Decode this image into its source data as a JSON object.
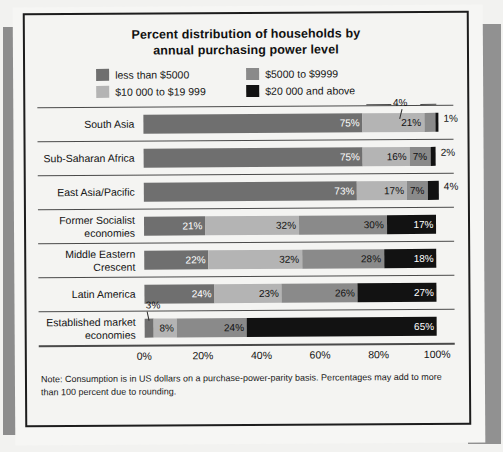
{
  "chart_data": {
    "type": "bar",
    "orientation": "horizontal",
    "stacked": true,
    "title": "Percent distribution of households by annual purchasing power level",
    "title_line1": "Percent distribution of households by",
    "title_line2": "annual purchasing power level",
    "xlabel": "",
    "ylabel": "",
    "xlim": [
      0,
      100
    ],
    "grid": false,
    "legend_position": "top",
    "tick_labels": [
      "0%",
      "20%",
      "40%",
      "60%",
      "80%",
      "100%"
    ],
    "tick_values": [
      0,
      20,
      40,
      60,
      80,
      100
    ],
    "categories": [
      "South Asia",
      "Sub-Saharan Africa",
      "East Asia/Pacific",
      "Former Socialist economies",
      "Middle Eastern Crescent",
      "Latin America",
      "Established market economies"
    ],
    "series": [
      {
        "name": "less than $5000",
        "color": "#6f6f6f",
        "values": [
          75,
          75,
          73,
          21,
          22,
          24,
          3
        ]
      },
      {
        "name": "$10 000 to $19 999",
        "color": "#b4b4b4",
        "values": [
          21,
          16,
          17,
          32,
          32,
          23,
          8
        ]
      },
      {
        "name": "$5000 to $9999",
        "color": "#8a8a8a",
        "values": [
          4,
          7,
          7,
          30,
          28,
          26,
          24
        ]
      },
      {
        "name": "$20 000 and above",
        "color": "#121212",
        "values": [
          1,
          2,
          4,
          17,
          18,
          27,
          65
        ]
      }
    ],
    "annotations": [
      {
        "label": "4%",
        "category": "South Asia",
        "series": "$5000 to $9999",
        "value": 4
      },
      {
        "label": "3%",
        "category": "Established market economies",
        "series": "less than $5000",
        "value": 3
      }
    ],
    "note": "Note: Consumption is in US dollars on a purchase-power-parity basis. Percentages may add to more than 100 percent due to rounding."
  },
  "legend": {
    "items": [
      {
        "label": "less than $5000",
        "color": "#6f6f6f"
      },
      {
        "label": "$5000 to $9999",
        "color": "#8a8a8a"
      },
      {
        "label": "$10 000 to $19 999",
        "color": "#b4b4b4"
      },
      {
        "label": "$20 000 and above",
        "color": "#121212"
      }
    ]
  },
  "rows": [
    {
      "label": "South Asia",
      "label_line1": "South Asia",
      "label_line2": "",
      "segments": [
        {
          "value": 75,
          "text": "75%",
          "color": "#6f6f6f",
          "text_color": "#ffffff",
          "inside": true
        },
        {
          "value": 21,
          "text": "21%",
          "color": "#b4b4b4",
          "text_color": "#111111",
          "inside": true
        },
        {
          "value": 4,
          "text": "",
          "color": "#8a8a8a",
          "text_color": "#111111",
          "inside": true
        },
        {
          "value": 1,
          "text": "",
          "color": "#121212",
          "text_color": "#111111",
          "inside": true
        }
      ],
      "outside_label": "1%",
      "callout": "4%"
    },
    {
      "label": "Sub-Saharan Africa",
      "label_line1": "Sub-Saharan Africa",
      "label_line2": "",
      "segments": [
        {
          "value": 75,
          "text": "75%",
          "color": "#6f6f6f",
          "text_color": "#ffffff",
          "inside": true
        },
        {
          "value": 16,
          "text": "16%",
          "color": "#b4b4b4",
          "text_color": "#111111",
          "inside": true
        },
        {
          "value": 7,
          "text": "7%",
          "color": "#8a8a8a",
          "text_color": "#111111",
          "inside": true
        },
        {
          "value": 2,
          "text": "",
          "color": "#121212",
          "text_color": "#ffffff",
          "inside": true
        }
      ],
      "outside_label": "2%",
      "callout": ""
    },
    {
      "label": "East Asia/Pacific",
      "label_line1": "East Asia/Pacific",
      "label_line2": "",
      "segments": [
        {
          "value": 73,
          "text": "73%",
          "color": "#6f6f6f",
          "text_color": "#ffffff",
          "inside": true
        },
        {
          "value": 17,
          "text": "17%",
          "color": "#b4b4b4",
          "text_color": "#111111",
          "inside": true
        },
        {
          "value": 7,
          "text": "7%",
          "color": "#8a8a8a",
          "text_color": "#111111",
          "inside": true
        },
        {
          "value": 4,
          "text": "",
          "color": "#121212",
          "text_color": "#ffffff",
          "inside": true
        }
      ],
      "outside_label": "4%",
      "callout": ""
    },
    {
      "label": "Former Socialist economies",
      "label_line1": "Former Socialist",
      "label_line2": "economies",
      "segments": [
        {
          "value": 21,
          "text": "21%",
          "color": "#6f6f6f",
          "text_color": "#ffffff",
          "inside": true
        },
        {
          "value": 32,
          "text": "32%",
          "color": "#b4b4b4",
          "text_color": "#111111",
          "inside": true
        },
        {
          "value": 30,
          "text": "30%",
          "color": "#8a8a8a",
          "text_color": "#111111",
          "inside": true
        },
        {
          "value": 17,
          "text": "17%",
          "color": "#121212",
          "text_color": "#ffffff",
          "inside": true
        }
      ],
      "outside_label": "",
      "callout": ""
    },
    {
      "label": "Middle Eastern Crescent",
      "label_line1": "Middle Eastern",
      "label_line2": "Crescent",
      "segments": [
        {
          "value": 22,
          "text": "22%",
          "color": "#6f6f6f",
          "text_color": "#ffffff",
          "inside": true
        },
        {
          "value": 32,
          "text": "32%",
          "color": "#b4b4b4",
          "text_color": "#111111",
          "inside": true
        },
        {
          "value": 28,
          "text": "28%",
          "color": "#8a8a8a",
          "text_color": "#111111",
          "inside": true
        },
        {
          "value": 18,
          "text": "18%",
          "color": "#121212",
          "text_color": "#ffffff",
          "inside": true
        }
      ],
      "outside_label": "",
      "callout": ""
    },
    {
      "label": "Latin America",
      "label_line1": "Latin America",
      "label_line2": "",
      "segments": [
        {
          "value": 24,
          "text": "24%",
          "color": "#6f6f6f",
          "text_color": "#ffffff",
          "inside": true
        },
        {
          "value": 23,
          "text": "23%",
          "color": "#b4b4b4",
          "text_color": "#111111",
          "inside": true
        },
        {
          "value": 26,
          "text": "26%",
          "color": "#8a8a8a",
          "text_color": "#111111",
          "inside": true
        },
        {
          "value": 27,
          "text": "27%",
          "color": "#121212",
          "text_color": "#ffffff",
          "inside": true
        }
      ],
      "outside_label": "",
      "callout": ""
    },
    {
      "label": "Established market economies",
      "label_line1": "Established market",
      "label_line2": "economies",
      "segments": [
        {
          "value": 3,
          "text": "",
          "color": "#6f6f6f",
          "text_color": "#ffffff",
          "inside": true
        },
        {
          "value": 8,
          "text": "8%",
          "color": "#b4b4b4",
          "text_color": "#111111",
          "inside": true
        },
        {
          "value": 24,
          "text": "24%",
          "color": "#8a8a8a",
          "text_color": "#111111",
          "inside": true
        },
        {
          "value": 65,
          "text": "65%",
          "color": "#121212",
          "text_color": "#ffffff",
          "inside": true
        }
      ],
      "outside_label": "",
      "callout": "3%"
    }
  ],
  "axis": {
    "ticks": [
      "0%",
      "20%",
      "40%",
      "60%",
      "80%",
      "100%"
    ]
  },
  "note": {
    "text": "Note: Consumption is in US dollars on a purchase-power-parity basis. Percentages may add to more than 100 percent due to rounding."
  }
}
